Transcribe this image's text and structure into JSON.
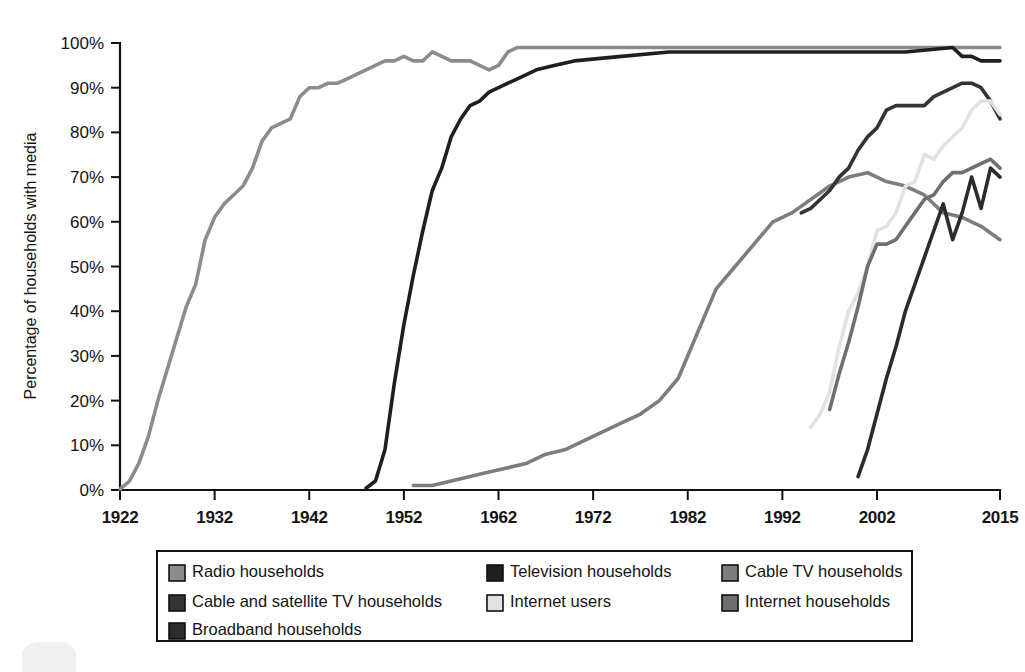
{
  "chart_data": {
    "type": "line",
    "title": "",
    "xlabel": "",
    "ylabel": "Percentage of households with media",
    "xlim": [
      1922,
      2015
    ],
    "ylim": [
      0,
      100
    ],
    "grid": false,
    "legend_position": "bottom",
    "x_ticks": [
      "1922",
      "1932",
      "1942",
      "1952",
      "1962",
      "1972",
      "1982",
      "1992",
      "2002",
      "2015"
    ],
    "x_tick_values": [
      1922,
      1932,
      1942,
      1952,
      1962,
      1972,
      1982,
      1992,
      2002,
      2015
    ],
    "y_ticks": [
      "0%",
      "10%",
      "20%",
      "30%",
      "40%",
      "50%",
      "60%",
      "70%",
      "80%",
      "90%",
      "100%"
    ],
    "y_tick_values": [
      0,
      10,
      20,
      30,
      40,
      50,
      60,
      70,
      80,
      90,
      100
    ],
    "series": [
      {
        "name": "Radio households",
        "color": "#8c8c8c",
        "x": [
          1922,
          1923,
          1924,
          1925,
          1926,
          1927,
          1928,
          1929,
          1930,
          1931,
          1932,
          1933,
          1934,
          1935,
          1936,
          1937,
          1938,
          1939,
          1940,
          1941,
          1942,
          1943,
          1944,
          1945,
          1946,
          1947,
          1948,
          1949,
          1950,
          1951,
          1952,
          1953,
          1954,
          1955,
          1956,
          1957,
          1958,
          1959,
          1960,
          1961,
          1962,
          1963,
          1964,
          1965,
          1970,
          1975,
          1980,
          1985,
          1990,
          1995,
          2000,
          2005,
          2010,
          2015
        ],
        "values": [
          0.2,
          2,
          6,
          12,
          20,
          27,
          34,
          41,
          46,
          56,
          61,
          64,
          66,
          68,
          72,
          78,
          81,
          82,
          83,
          88,
          90,
          90,
          91,
          91,
          92,
          93,
          94,
          95,
          96,
          96,
          97,
          96,
          96,
          98,
          97,
          96,
          96,
          96,
          95,
          94,
          95,
          98,
          99,
          99,
          99,
          99,
          99,
          99,
          99,
          99,
          99,
          99,
          99,
          99
        ]
      },
      {
        "name": "Television households",
        "color": "#1f1f1f",
        "x": [
          1948,
          1949,
          1950,
          1951,
          1952,
          1953,
          1954,
          1955,
          1956,
          1957,
          1958,
          1959,
          1960,
          1961,
          1962,
          1963,
          1964,
          1965,
          1966,
          1968,
          1970,
          1975,
          1980,
          1985,
          1990,
          1995,
          2000,
          2005,
          2010,
          2011,
          2012,
          2013,
          2014,
          2015
        ],
        "values": [
          0.4,
          2,
          9,
          24,
          37,
          48,
          58,
          67,
          72,
          79,
          83,
          86,
          87,
          89,
          90,
          91,
          92,
          93,
          94,
          95,
          96,
          97,
          98,
          98,
          98,
          98,
          98,
          98,
          99,
          97,
          97,
          96,
          96,
          96
        ]
      },
      {
        "name": "Cable TV households",
        "color": "#7d7d7d",
        "x": [
          1953,
          1955,
          1957,
          1959,
          1961,
          1963,
          1965,
          1967,
          1969,
          1971,
          1973,
          1975,
          1977,
          1979,
          1981,
          1983,
          1985,
          1987,
          1989,
          1991,
          1993,
          1995,
          1997,
          1999,
          2001,
          2003,
          2005,
          2007,
          2009,
          2011,
          2013,
          2015
        ],
        "values": [
          1,
          1,
          2,
          3,
          4,
          5,
          6,
          8,
          9,
          11,
          13,
          15,
          17,
          20,
          25,
          35,
          45,
          50,
          55,
          60,
          62,
          65,
          68,
          70,
          71,
          69,
          68,
          66,
          62,
          61,
          59,
          56
        ]
      },
      {
        "name": "Cable and satellite TV households",
        "color": "#343434",
        "x": [
          1994,
          1995,
          1996,
          1997,
          1998,
          1999,
          2000,
          2001,
          2002,
          2003,
          2004,
          2005,
          2006,
          2007,
          2008,
          2009,
          2010,
          2011,
          2012,
          2013,
          2014,
          2015
        ],
        "values": [
          62,
          63,
          65,
          67,
          70,
          72,
          76,
          79,
          81,
          85,
          86,
          86,
          86,
          86,
          88,
          89,
          90,
          91,
          91,
          90,
          87,
          83
        ]
      },
      {
        "name": "Internet users",
        "color": "#e2e2e2",
        "x": [
          1995,
          1996,
          1997,
          1998,
          1999,
          2000,
          2001,
          2002,
          2003,
          2004,
          2005,
          2006,
          2007,
          2008,
          2009,
          2010,
          2011,
          2012,
          2013,
          2014,
          2015
        ],
        "values": [
          14,
          17,
          22,
          32,
          40,
          44,
          50,
          58,
          59,
          62,
          68,
          69,
          75,
          74,
          77,
          79,
          81,
          85,
          87,
          87,
          84
        ]
      },
      {
        "name": "Internet households",
        "color": "#6f6f6f",
        "x": [
          1997,
          1998,
          1999,
          2000,
          2001,
          2002,
          2003,
          2004,
          2005,
          2006,
          2007,
          2008,
          2009,
          2010,
          2011,
          2012,
          2013,
          2014,
          2015
        ],
        "values": [
          18,
          26,
          33,
          41,
          50,
          55,
          55,
          56,
          59,
          62,
          65,
          66,
          69,
          71,
          71,
          72,
          73,
          74,
          72
        ]
      },
      {
        "name": "Broadband households",
        "color": "#2b2b2b",
        "x": [
          2000,
          2001,
          2002,
          2003,
          2004,
          2005,
          2006,
          2007,
          2008,
          2009,
          2010,
          2011,
          2012,
          2013,
          2014,
          2015
        ],
        "values": [
          3,
          9,
          17,
          25,
          32,
          40,
          46,
          52,
          58,
          64,
          56,
          62,
          70,
          63,
          72,
          70
        ]
      }
    ],
    "legend": [
      {
        "label": "Radio households",
        "color": "#8c8c8c"
      },
      {
        "label": "Television households",
        "color": "#1f1f1f"
      },
      {
        "label": "Cable TV households",
        "color": "#7d7d7d"
      },
      {
        "label": "Cable and satellite TV households",
        "color": "#343434"
      },
      {
        "label": "Internet users",
        "color": "#e2e2e2"
      },
      {
        "label": "Internet households",
        "color": "#6f6f6f"
      },
      {
        "label": "Broadband households",
        "color": "#2b2b2b"
      }
    ]
  },
  "plot_geometry": {
    "left": 120,
    "right": 1000,
    "top": 43,
    "bottom": 490
  },
  "legend_geometry": {
    "x": 157,
    "y": 551,
    "width": 755,
    "height": 90,
    "columns": [
      12,
      330,
      565
    ],
    "rows": [
      22,
      52,
      80
    ]
  }
}
